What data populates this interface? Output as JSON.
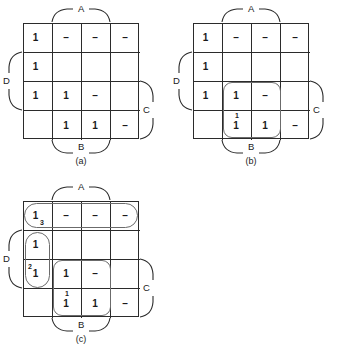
{
  "figure": {
    "maps": [
      {
        "id": "a",
        "caption": "(a)",
        "labels": {
          "top": "A",
          "bottom": "B",
          "left": "D",
          "right": "C"
        },
        "cells": [
          [
            "1",
            "–",
            "–",
            "–"
          ],
          [
            "1",
            "",
            "",
            ""
          ],
          [
            "1",
            "1",
            "–",
            ""
          ],
          [
            "",
            "1",
            "1",
            "–"
          ]
        ],
        "groups": []
      },
      {
        "id": "b",
        "caption": "(b)",
        "labels": {
          "top": "A",
          "bottom": "B",
          "left": "D",
          "right": "C"
        },
        "cells": [
          [
            "1",
            "–",
            "–",
            "–"
          ],
          [
            "1",
            "",
            "",
            ""
          ],
          [
            "1",
            "1",
            "–",
            ""
          ],
          [
            "",
            "1",
            "1",
            "–"
          ]
        ],
        "groups": [
          {
            "name": "group-1",
            "shape": "box",
            "number": "1"
          }
        ]
      },
      {
        "id": "c",
        "caption": "(c)",
        "labels": {
          "top": "A",
          "bottom": "B",
          "left": "D",
          "right": "C"
        },
        "cells": [
          [
            "1",
            "–",
            "–",
            "–"
          ],
          [
            "1",
            "",
            "",
            ""
          ],
          [
            "1",
            "1",
            "–",
            ""
          ],
          [
            "",
            "1",
            "1",
            "–"
          ]
        ],
        "groups": [
          {
            "name": "group-1",
            "shape": "box",
            "number": "1"
          },
          {
            "name": "group-2",
            "shape": "oval-v",
            "number": "2"
          },
          {
            "name": "group-3",
            "shape": "oval-h",
            "number": "3"
          }
        ]
      }
    ]
  }
}
